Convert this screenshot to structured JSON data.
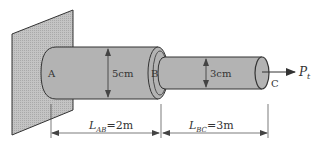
{
  "diagram": {
    "type": "stepped-shaft-axial-load",
    "colors": {
      "wall_fill": "#b8b8b8",
      "shaft_fill": "#b3b3b3",
      "outline": "#333333",
      "dimension_line": "#444444"
    },
    "points": {
      "A": "A",
      "B": "B",
      "C": "C"
    },
    "segments": {
      "AB": {
        "diameter_label": "5cm",
        "length_symbol": "L",
        "length_subscript": "AB",
        "length_value": "=2m"
      },
      "BC": {
        "diameter_label": "3cm",
        "length_symbol": "L",
        "length_subscript": "BC",
        "length_value": "=3m"
      }
    },
    "load": {
      "symbol": "P",
      "subscript": "t",
      "direction": "right"
    }
  }
}
